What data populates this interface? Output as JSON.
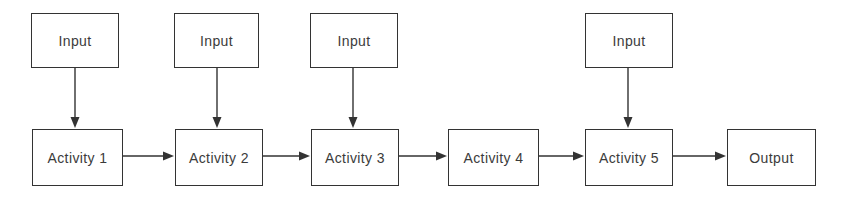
{
  "diagram": {
    "type": "flowchart",
    "background_color": "#ffffff",
    "line_color": "#333333",
    "text_color": "#3b3b3b",
    "nodes": [
      {
        "id": "input-1",
        "label": "Input",
        "x": 31,
        "y": 13,
        "w": 88,
        "h": 55
      },
      {
        "id": "input-2",
        "label": "Input",
        "x": 174,
        "y": 13,
        "w": 85,
        "h": 55
      },
      {
        "id": "input-3",
        "label": "Input",
        "x": 310,
        "y": 13,
        "w": 88,
        "h": 55
      },
      {
        "id": "input-4",
        "label": "Input",
        "x": 585,
        "y": 13,
        "w": 88,
        "h": 55
      },
      {
        "id": "activity-1",
        "label": "Activity 1",
        "x": 32,
        "y": 129,
        "w": 91,
        "h": 57
      },
      {
        "id": "activity-2",
        "label": "Activity 2",
        "x": 175,
        "y": 129,
        "w": 88,
        "h": 57
      },
      {
        "id": "activity-3",
        "label": "Activity 3",
        "x": 311,
        "y": 129,
        "w": 88,
        "h": 57
      },
      {
        "id": "activity-4",
        "label": "Activity 4",
        "x": 448,
        "y": 129,
        "w": 91,
        "h": 57
      },
      {
        "id": "activity-5",
        "label": "Activity 5",
        "x": 585,
        "y": 129,
        "w": 88,
        "h": 57
      },
      {
        "id": "output-1",
        "label": "Output",
        "x": 727,
        "y": 129,
        "w": 89,
        "h": 57
      }
    ],
    "edges": [
      {
        "id": "edge-input1-activity1",
        "from": "input-1",
        "to": "activity-1",
        "direction": "down",
        "x1": 75,
        "y1": 68,
        "x2": 75,
        "y2": 128
      },
      {
        "id": "edge-input2-activity2",
        "from": "input-2",
        "to": "activity-2",
        "direction": "down",
        "x1": 217,
        "y1": 68,
        "x2": 217,
        "y2": 128
      },
      {
        "id": "edge-input3-activity3",
        "from": "input-3",
        "to": "activity-3",
        "direction": "down",
        "x1": 353,
        "y1": 68,
        "x2": 353,
        "y2": 128
      },
      {
        "id": "edge-input4-activity5",
        "from": "input-4",
        "to": "activity-5",
        "direction": "down",
        "x1": 628,
        "y1": 68,
        "x2": 628,
        "y2": 128
      },
      {
        "id": "edge-activity1-activity2",
        "from": "activity-1",
        "to": "activity-2",
        "direction": "right",
        "x1": 123,
        "y1": 156,
        "x2": 174,
        "y2": 156
      },
      {
        "id": "edge-activity2-activity3",
        "from": "activity-2",
        "to": "activity-3",
        "direction": "right",
        "x1": 263,
        "y1": 156,
        "x2": 310,
        "y2": 156
      },
      {
        "id": "edge-activity3-activity4",
        "from": "activity-3",
        "to": "activity-4",
        "direction": "right",
        "x1": 399,
        "y1": 156,
        "x2": 447,
        "y2": 156
      },
      {
        "id": "edge-activity4-activity5",
        "from": "activity-4",
        "to": "activity-5",
        "direction": "right",
        "x1": 539,
        "y1": 156,
        "x2": 584,
        "y2": 156
      },
      {
        "id": "edge-activity5-output1",
        "from": "activity-5",
        "to": "output-1",
        "direction": "right",
        "x1": 673,
        "y1": 156,
        "x2": 726,
        "y2": 156
      }
    ]
  }
}
